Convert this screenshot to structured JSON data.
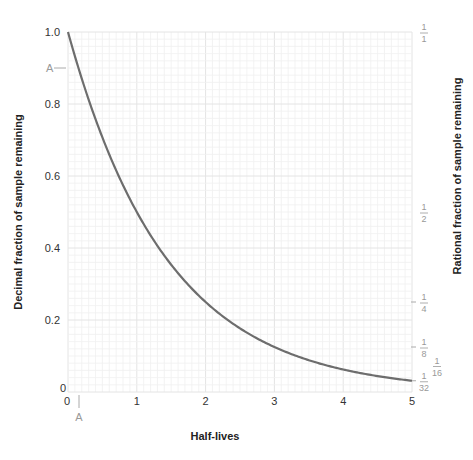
{
  "chart_data": {
    "type": "line",
    "title": "",
    "xlabel": "Half-lives",
    "ylabel": "Decimal fraction of sample remaining",
    "ylabel_right": "Rational fraction of sample remaining",
    "xlim": [
      0,
      5
    ],
    "ylim": [
      0,
      1.0
    ],
    "grid": true,
    "x_ticks": [
      "0",
      "1",
      "2",
      "3",
      "4",
      "5"
    ],
    "y_ticks": [
      "0",
      "0.2",
      "0.4",
      "0.6",
      "0.8",
      "1.0"
    ],
    "y_tick_zero_label": "0",
    "right_ticks": [
      {
        "num": "1",
        "den": "1",
        "value": 1.0
      },
      {
        "num": "1",
        "den": "2",
        "value": 0.5
      },
      {
        "num": "1",
        "den": "4",
        "value": 0.25
      },
      {
        "num": "1",
        "den": "8",
        "value": 0.125
      },
      {
        "num": "1",
        "den": "16",
        "value": 0.0625
      },
      {
        "num": "1",
        "den": "32",
        "value": 0.03125
      }
    ],
    "annotations": [
      {
        "label": "A",
        "axis": "y",
        "value": 0.9
      },
      {
        "label": "A",
        "axis": "x",
        "value": 0.15
      }
    ],
    "series": [
      {
        "name": "Fraction remaining",
        "color": "#6d6d6d",
        "x": [
          0,
          0.5,
          1,
          1.5,
          2,
          2.5,
          3,
          3.5,
          4,
          4.5,
          5
        ],
        "values": [
          1.0,
          0.707,
          0.5,
          0.354,
          0.25,
          0.177,
          0.125,
          0.088,
          0.0625,
          0.044,
          0.03125
        ]
      }
    ]
  },
  "labels": {
    "y_annot": "A",
    "x_annot": "A"
  }
}
